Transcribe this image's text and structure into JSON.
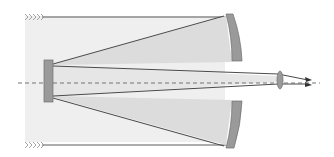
{
  "diagram": {
    "elements": [
      {
        "name": "incoming-light-top",
        "icon": "chevron-arrows-icon"
      },
      {
        "name": "incoming-light-bottom",
        "icon": "chevron-arrows-icon"
      },
      {
        "name": "telescope-tube"
      },
      {
        "name": "primary-mirror-top"
      },
      {
        "name": "primary-mirror-bottom"
      },
      {
        "name": "secondary-mirror"
      },
      {
        "name": "eyepiece-lens"
      },
      {
        "name": "optical-axis",
        "style": "dashed"
      },
      {
        "name": "output-rays",
        "count": 2
      }
    ],
    "colors": {
      "tube_fill": "#efefef",
      "beam_fill": "#dcdcdc",
      "mirror_fill": "#9a9a9a",
      "mirror_stroke": "#6f6f6f",
      "line": "#4a4a4a",
      "axis": "#666666",
      "chevrons": "#9a9a9a"
    }
  }
}
